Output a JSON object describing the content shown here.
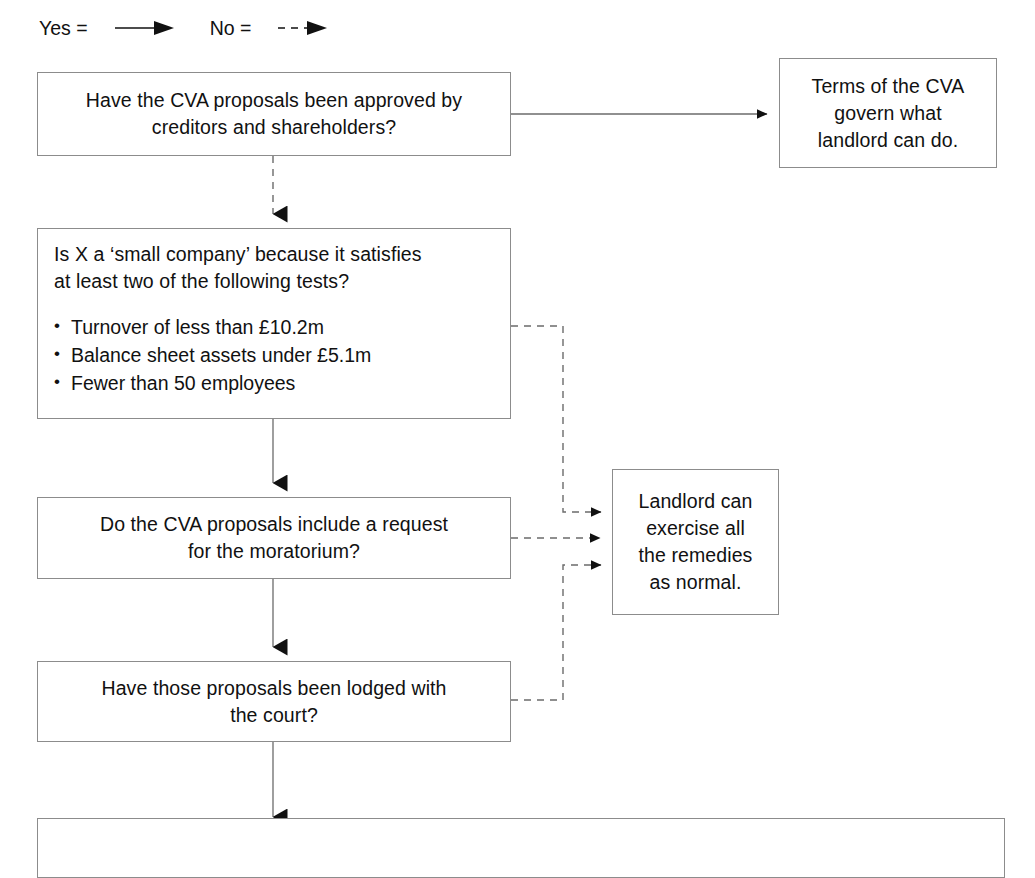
{
  "document": {
    "type": "decision-flowchart",
    "subject": "CVA (Company Voluntary Arrangement) landlord remedies decision tree"
  },
  "legend": {
    "yes_label": "Yes =",
    "yes_icon": "solid-arrow-icon",
    "no_label": "No =",
    "no_icon": "dashed-arrow-icon"
  },
  "nodes": {
    "cva_approved": {
      "lines": [
        "Have the CVA proposals been approved by",
        "creditors and shareholders?"
      ]
    },
    "terms_govern": {
      "lines": [
        "Terms of the CVA",
        "govern what",
        "landlord can do."
      ]
    },
    "small_company": {
      "lines": [
        "Is X a ‘small company’ because it satisfies",
        "at least two of the following tests?"
      ],
      "bullets": [
        "Turnover of less than £10.2m",
        "Balance sheet assets under £5.1m",
        "Fewer than 50 employees"
      ]
    },
    "moratorium_request": {
      "lines": [
        "Do the CVA proposals include a request",
        "for the moratorium?"
      ]
    },
    "lodged_with_court": {
      "lines": [
        "Have those proposals been lodged with",
        "the court?"
      ]
    },
    "landlord_remedies": {
      "lines": [
        "Landlord can",
        "exercise all",
        "the remedies",
        "as normal."
      ]
    },
    "bottom_cut_off": {
      "lines": [
        ""
      ]
    }
  },
  "edges": [
    {
      "name": "approved-yes-to-terms",
      "from": "cva_approved",
      "to": "terms_govern",
      "style": "solid",
      "answer": "Yes"
    },
    {
      "name": "approved-no-to-small-company",
      "from": "cva_approved",
      "to": "small_company",
      "style": "dashed",
      "answer": "No"
    },
    {
      "name": "small-company-no-to-landlord",
      "from": "small_company",
      "to": "landlord_remedies",
      "style": "dashed",
      "answer": "No"
    },
    {
      "name": "small-company-yes-to-moratorium",
      "from": "small_company",
      "to": "moratorium_request",
      "style": "solid",
      "answer": "Yes"
    },
    {
      "name": "moratorium-no-to-landlord",
      "from": "moratorium_request",
      "to": "landlord_remedies",
      "style": "dashed",
      "answer": "No"
    },
    {
      "name": "moratorium-yes-to-lodged",
      "from": "moratorium_request",
      "to": "lodged_with_court",
      "style": "solid",
      "answer": "Yes"
    },
    {
      "name": "lodged-no-to-landlord",
      "from": "lodged_with_court",
      "to": "landlord_remedies",
      "style": "dashed",
      "answer": "No"
    },
    {
      "name": "lodged-yes-to-bottom",
      "from": "lodged_with_court",
      "to": "bottom_cut_off",
      "style": "solid",
      "answer": "Yes"
    }
  ],
  "colors": {
    "ink": "#111111",
    "box_border": "#8c8c8c",
    "edge": "#6b6b6b",
    "background": "#ffffff"
  }
}
